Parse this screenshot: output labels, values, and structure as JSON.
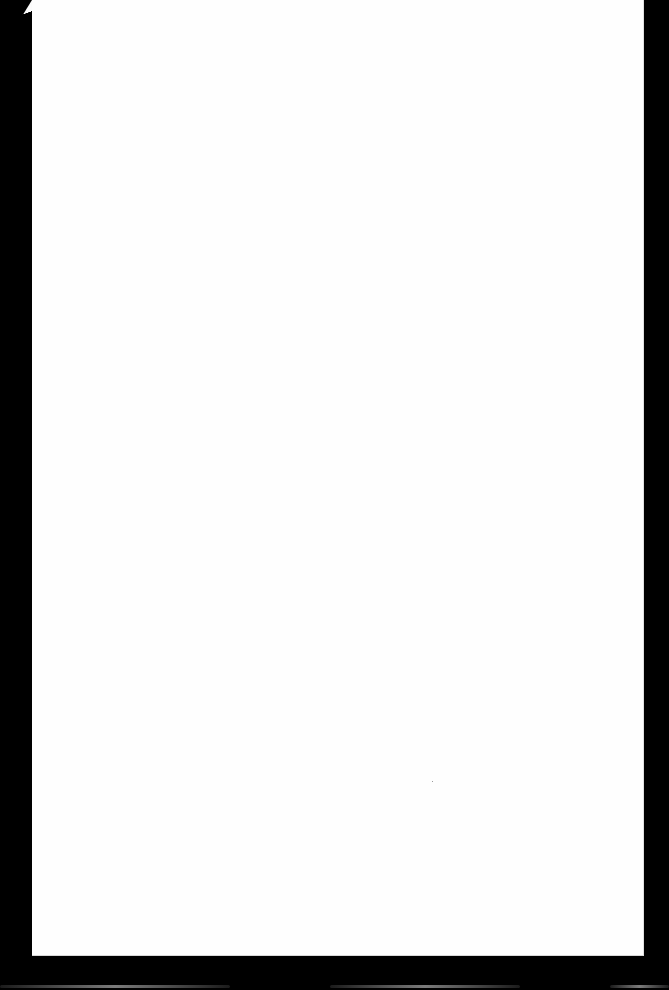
{
  "document": {
    "page_text": "",
    "background_color": "#000000",
    "page_color": "#fefefe"
  }
}
